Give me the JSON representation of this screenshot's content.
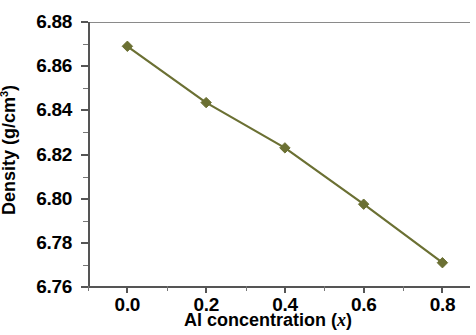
{
  "chart_data": {
    "type": "line",
    "title": "",
    "xlabel": "Al  concentration (x)",
    "xlabel_plain": "Al concentration",
    "xlabel_symbol": "x",
    "ylabel": "Density (g/cm3)",
    "ylabel_plain": "Density (g/cm",
    "ylabel_sup": "3",
    "ylabel_close": ")",
    "x": [
      0.0,
      0.2,
      0.4,
      0.6,
      0.8
    ],
    "values": [
      6.869,
      6.8435,
      6.823,
      6.7975,
      6.771
    ],
    "series": [
      {
        "name": "Density",
        "values": [
          6.869,
          6.8435,
          6.823,
          6.7975,
          6.771
        ]
      }
    ],
    "xlim": [
      -0.1,
      0.87
    ],
    "ylim": [
      6.76,
      6.88
    ],
    "xticks": [
      0.0,
      0.2,
      0.4,
      0.6,
      0.8
    ],
    "xticklabels": [
      "0.0",
      "0.2",
      "0.4",
      "0.6",
      "0.8"
    ],
    "yticks": [
      6.76,
      6.78,
      6.8,
      6.82,
      6.84,
      6.86,
      6.88
    ],
    "yticklabels": [
      "6.76",
      "6.78",
      "6.80",
      "6.82",
      "6.84",
      "6.86",
      "6.88"
    ],
    "xminorticks": [
      -0.1,
      0.1,
      0.3,
      0.5,
      0.7
    ],
    "yminorticks": [
      6.77,
      6.79,
      6.81,
      6.83,
      6.85,
      6.87
    ],
    "grid": false,
    "legend": null,
    "line_color": "#6b7033",
    "marker_color": "#6b7033",
    "marker_shape": "diamond",
    "axis_color": "#555555",
    "background": "#ffffff"
  }
}
